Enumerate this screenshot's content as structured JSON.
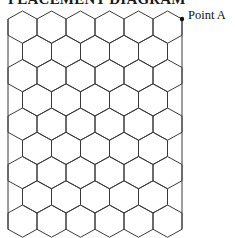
{
  "title": "PLACEMENT DIAGRAM",
  "point": {
    "label": "Point A",
    "x": 182,
    "y": 19,
    "color": "#111111"
  },
  "grid": {
    "rows": 9,
    "odd_row_hex_count": 6,
    "even_row_hex_count": 5,
    "left": 8,
    "right": 182,
    "hex_half_width": 14.5,
    "first_peak_y": 11,
    "row_pitch": 24.25,
    "cap_height": 8,
    "line_color": "#3a3a3a",
    "line_width": 1
  }
}
